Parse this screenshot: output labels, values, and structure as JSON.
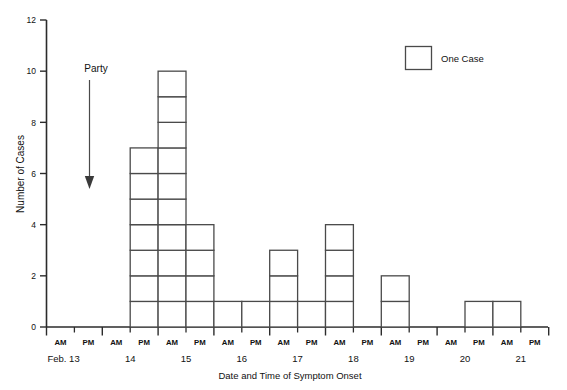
{
  "chart_data": {
    "type": "bar",
    "title": "",
    "xlabel": "Date and Time of Symptom Onset",
    "ylabel": "Number of Cases",
    "ylim": [
      0,
      12
    ],
    "yticks": [
      0,
      2,
      4,
      6,
      8,
      10,
      12
    ],
    "grid": false,
    "legend": {
      "position": "top-right",
      "entries": [
        {
          "label": "One Case",
          "marker": "empty-square"
        }
      ]
    },
    "annotations": [
      {
        "label": "Party",
        "type": "down-arrow",
        "x_slot": "Feb 13 PM",
        "y_from": 10,
        "y_to": 5.2
      }
    ],
    "month_label": "Feb.",
    "days": [
      "13",
      "14",
      "15",
      "16",
      "17",
      "18",
      "19",
      "20",
      "21"
    ],
    "categories": [
      "13 AM",
      "13 PM",
      "14 AM",
      "14 PM",
      "15 AM",
      "15 PM",
      "16 AM",
      "16 PM",
      "17 AM",
      "17 PM",
      "18 AM",
      "18 PM",
      "19 AM",
      "19 PM",
      "20 AM",
      "20 PM",
      "21 AM",
      "21 PM"
    ],
    "tick_labels": [
      "AM",
      "PM",
      "AM",
      "PM",
      "AM",
      "PM",
      "AM",
      "PM",
      "AM",
      "PM",
      "AM",
      "PM",
      "AM",
      "PM",
      "AM",
      "PM",
      "AM",
      "PM"
    ],
    "values": [
      0,
      0,
      0,
      7,
      10,
      4,
      1,
      1,
      3,
      1,
      4,
      0,
      2,
      0,
      0,
      1,
      1,
      0
    ],
    "total_cases": 34
  },
  "axes": {
    "y_title": "Number of Cases",
    "x_title": "Date and Time of Symptom Onset"
  },
  "legend": {
    "label": "One Case"
  },
  "annotation": {
    "party_label": "Party"
  }
}
